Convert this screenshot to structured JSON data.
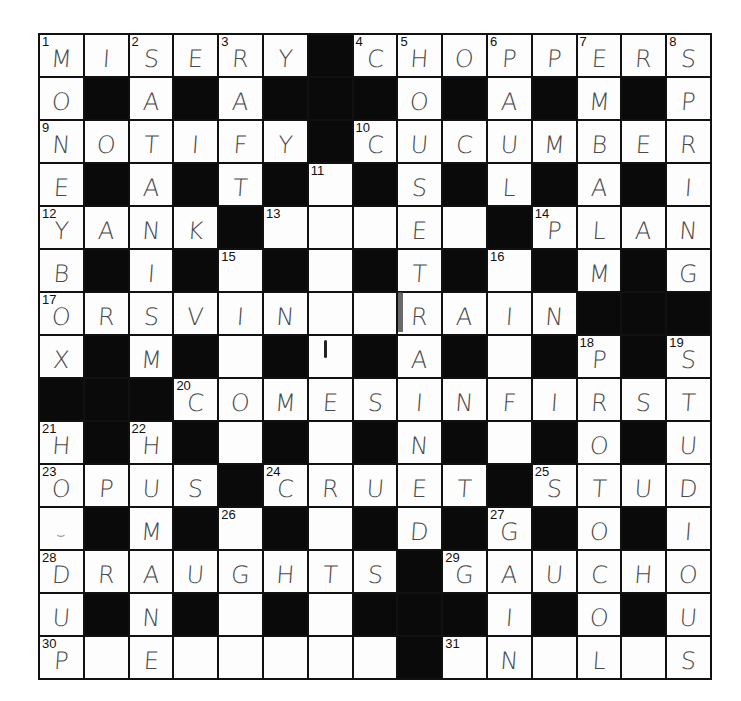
{
  "puzzle": {
    "size": 15,
    "rows": [
      "MISERY#CHOPPERS",
      "O#A#A###O#A#M#P",
      "NOTIFY#CUCUMBER",
      "E#A#T#_#S#L#A#I",
      "YANK#___E_#PLAN",
      "B#I#_#_#T#_#M#G",
      "ORSVIN__RAIN###",
      "X#M#_#_#A#_#P#S",
      "###COMESINFIRST",
      "H#H#_#_#N#_#O#U",
      "OPUS#CRUET#STUD",
      "~#M#_#_#D#G#O#I",
      "DRAUGHTS#GAUCHO",
      "U#N#_#_###I#O#U",
      "P_E_____#_N_L_S"
    ],
    "numbers": [
      {
        "r": 0,
        "c": 0,
        "n": "1"
      },
      {
        "r": 0,
        "c": 2,
        "n": "2"
      },
      {
        "r": 0,
        "c": 4,
        "n": "3"
      },
      {
        "r": 0,
        "c": 7,
        "n": "4"
      },
      {
        "r": 0,
        "c": 8,
        "n": "5"
      },
      {
        "r": 0,
        "c": 10,
        "n": "6"
      },
      {
        "r": 0,
        "c": 12,
        "n": "7"
      },
      {
        "r": 0,
        "c": 14,
        "n": "8"
      },
      {
        "r": 2,
        "c": 0,
        "n": "9"
      },
      {
        "r": 2,
        "c": 7,
        "n": "10"
      },
      {
        "r": 3,
        "c": 6,
        "n": "11"
      },
      {
        "r": 4,
        "c": 0,
        "n": "12"
      },
      {
        "r": 4,
        "c": 5,
        "n": "13"
      },
      {
        "r": 4,
        "c": 11,
        "n": "14"
      },
      {
        "r": 5,
        "c": 4,
        "n": "15"
      },
      {
        "r": 5,
        "c": 10,
        "n": "16"
      },
      {
        "r": 6,
        "c": 0,
        "n": "17"
      },
      {
        "r": 7,
        "c": 12,
        "n": "18"
      },
      {
        "r": 7,
        "c": 14,
        "n": "19"
      },
      {
        "r": 8,
        "c": 3,
        "n": "20"
      },
      {
        "r": 9,
        "c": 0,
        "n": "21"
      },
      {
        "r": 9,
        "c": 2,
        "n": "22"
      },
      {
        "r": 10,
        "c": 0,
        "n": "23"
      },
      {
        "r": 10,
        "c": 5,
        "n": "24"
      },
      {
        "r": 10,
        "c": 11,
        "n": "25"
      },
      {
        "r": 11,
        "c": 4,
        "n": "26"
      },
      {
        "r": 11,
        "c": 10,
        "n": "27"
      },
      {
        "r": 12,
        "c": 0,
        "n": "28"
      },
      {
        "r": 12,
        "c": 9,
        "n": "29"
      },
      {
        "r": 14,
        "c": 0,
        "n": "30"
      },
      {
        "r": 14,
        "c": 9,
        "n": "31"
      }
    ],
    "legend": {
      "black": "#",
      "empty": "_",
      "partial_mark": "~"
    },
    "partial_mark_glyph": "⌣",
    "colors": {
      "grid_line": "#111111",
      "block": "#0a0a0a",
      "cell": "#fdfdfd",
      "pencil": "#4a4a4a"
    }
  }
}
